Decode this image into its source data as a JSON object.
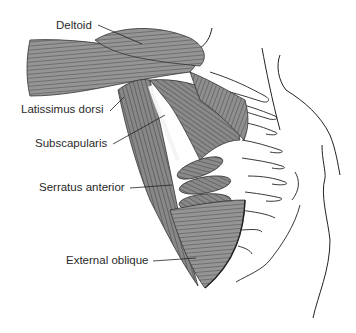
{
  "figure": {
    "labels": [
      {
        "id": "deltoid",
        "text": "Deltoid",
        "x": 56,
        "y": 20
      },
      {
        "id": "latissimus-dorsi",
        "text": "Latissimus dorsi",
        "x": 21,
        "y": 109
      },
      {
        "id": "subscapularis",
        "text": "Subscapularis",
        "x": 35,
        "y": 139
      },
      {
        "id": "serratus-anterior",
        "text": "Serratus anterior",
        "x": 39,
        "y": 183
      },
      {
        "id": "external-oblique",
        "text": "External oblique",
        "x": 66,
        "y": 255
      }
    ],
    "colors": {
      "muscle_fill": "#8a8a8a",
      "muscle_line": "#333333",
      "outline": "#222222",
      "background": "#ffffff",
      "label_text": "#2a2a2a"
    }
  }
}
